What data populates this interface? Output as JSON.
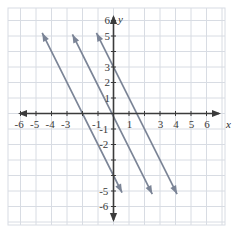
{
  "figure": {
    "kind": "coordinate-plane",
    "background_color": "#ffffff",
    "grid_color": "#d8dce3",
    "plot_border_color": "#d8dce3",
    "axis_color": "#3b3b3b",
    "line_color": "#7b8496",
    "label_color": "#3a3a3a"
  },
  "axes": {
    "x_name": "x",
    "y_name": "y",
    "x_min": -6.9,
    "x_max": 6.9,
    "y_min": -6.9,
    "y_max": 6.9,
    "x_tick_labels": [
      "-6",
      "-5",
      "-4",
      "-3",
      "-1",
      "1",
      "3",
      "4",
      "5",
      "6"
    ],
    "x_tick_values": [
      -6,
      -5,
      -4,
      -3,
      -1,
      1,
      3,
      4,
      5,
      6
    ],
    "y_tick_labels": [
      "6",
      "5",
      "3",
      "2",
      "1",
      "-1",
      "-2",
      "-5",
      "-6"
    ],
    "y_tick_values": [
      6,
      5,
      3,
      2,
      1,
      -1,
      -2,
      -5,
      -6
    ],
    "hidden_x_labels": [
      "-2",
      "2"
    ],
    "hidden_y_labels": [
      "4",
      "-3",
      "-4"
    ],
    "grid_step": 1
  },
  "chart_data": {
    "type": "line",
    "title": "",
    "xlabel": "x",
    "ylabel": "y",
    "xlim": [
      -6.9,
      6.9
    ],
    "ylim": [
      -6.9,
      6.9
    ],
    "grid": true,
    "legend": "none",
    "series": [
      {
        "name": "line-left",
        "slope": -2,
        "intercept": -4,
        "x_intercept": -2,
        "color": "#7b8496",
        "arrows": [
          "start",
          "end"
        ],
        "points": [
          [
            -4.6,
            5.2
          ],
          [
            0.55,
            -5.1
          ]
        ]
      },
      {
        "name": "line-middle",
        "slope": -2,
        "intercept": -0.2,
        "x_intercept": -0.1,
        "color": "#7b8496",
        "arrows": [
          "start",
          "end"
        ],
        "points": [
          [
            -2.65,
            5.1
          ],
          [
            2.5,
            -5.2
          ]
        ]
      },
      {
        "name": "line-right",
        "slope": -2,
        "intercept": 3,
        "x_intercept": 1.5,
        "color": "#7b8496",
        "arrows": [
          "start",
          "end"
        ],
        "points": [
          [
            -1.1,
            5.2
          ],
          [
            4.1,
            -5.2
          ]
        ]
      }
    ]
  }
}
